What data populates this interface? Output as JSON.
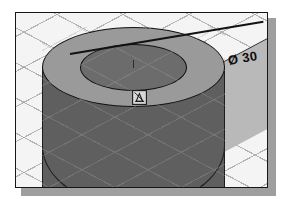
{
  "scene": {
    "title": "Isometric CAD viewport",
    "view_type": "isometric",
    "grid": "isometric-diamond"
  },
  "dimension": {
    "symbol": "Ø",
    "value": "30",
    "label": "Ø 30",
    "type": "diameter"
  },
  "geometry": {
    "solid": "cylinder",
    "top_face_label": "top-face",
    "inner_circle_label": "inner-circle",
    "body_label": "cylinder-body",
    "ground_label": "ground-plane"
  },
  "cursor": {
    "name": "center-snap-cursor"
  },
  "colors": {
    "background": "#f6f6f6",
    "grid_line": "#9e9e9e",
    "top_face": "#9a9a9a",
    "inner_circle": "#6c6c6c",
    "body": "#5f5f5f",
    "ground": "#b9b9b9",
    "outline": "#141414",
    "dimension_text": "#0d0d0d",
    "shadow": "#9e9e9e"
  }
}
